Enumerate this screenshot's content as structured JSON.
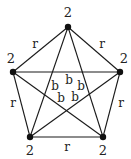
{
  "diagram": {
    "type": "complete-graph-K5",
    "vertices": [
      {
        "id": "v0",
        "x": 68,
        "y": 27,
        "label": "2",
        "lx": 68,
        "ly": 13
      },
      {
        "id": "v1",
        "x": 120,
        "y": 72,
        "label": "2",
        "lx": 124,
        "ly": 59
      },
      {
        "id": "v2",
        "x": 103,
        "y": 137,
        "label": "2",
        "lx": 103,
        "ly": 151
      },
      {
        "id": "v3",
        "x": 30,
        "y": 137,
        "label": "2",
        "lx": 30,
        "ly": 151
      },
      {
        "id": "v4",
        "x": 13,
        "y": 72,
        "label": "2",
        "lx": 11,
        "ly": 59
      }
    ],
    "outer_edges": [
      {
        "from": "v0",
        "to": "v1",
        "label": "r",
        "lx": 102,
        "ly": 44
      },
      {
        "from": "v1",
        "to": "v2",
        "label": "r",
        "lx": 121,
        "ly": 103
      },
      {
        "from": "v2",
        "to": "v3",
        "label": "r",
        "lx": 67,
        "ly": 147
      },
      {
        "from": "v3",
        "to": "v4",
        "label": "r",
        "lx": 13,
        "ly": 103
      },
      {
        "from": "v4",
        "to": "v0",
        "label": "r",
        "lx": 35,
        "ly": 44
      }
    ],
    "inner_edges": [
      {
        "from": "v0",
        "to": "v2",
        "label": "b",
        "lx": 81,
        "ly": 86
      },
      {
        "from": "v0",
        "to": "v3",
        "label": "b",
        "lx": 55,
        "ly": 86
      },
      {
        "from": "v1",
        "to": "v3",
        "label": "b",
        "lx": 75,
        "ly": 97
      },
      {
        "from": "v1",
        "to": "v4",
        "label": "b",
        "lx": 69,
        "ly": 80
      },
      {
        "from": "v2",
        "to": "v4",
        "label": "b",
        "lx": 61,
        "ly": 98
      }
    ]
  }
}
